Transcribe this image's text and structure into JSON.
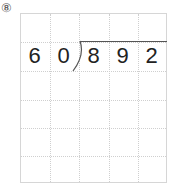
{
  "problem_label": "⑧",
  "divisor": [
    "6",
    "0"
  ],
  "dividend": [
    "8",
    "9",
    "2"
  ],
  "grid": {
    "columns": 5,
    "rows": 6
  }
}
